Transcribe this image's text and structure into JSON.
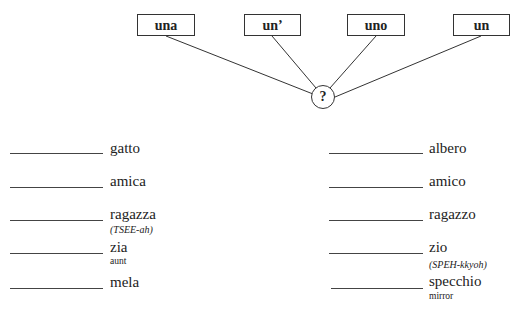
{
  "diagram": {
    "articles": [
      {
        "label": "una"
      },
      {
        "label": "un’"
      },
      {
        "label": "uno"
      },
      {
        "label": "un"
      }
    ],
    "center": {
      "label": "?"
    }
  },
  "exercise": {
    "left": [
      {
        "word": "gatto"
      },
      {
        "word": "amica"
      },
      {
        "word": "ragazza",
        "pronunciation": "(TSEE-ah)"
      },
      {
        "word": "zia",
        "gloss": "aunt"
      },
      {
        "word": "mela"
      }
    ],
    "right": [
      {
        "word": "albero"
      },
      {
        "word": "amico"
      },
      {
        "word": "ragazzo"
      },
      {
        "word": "zio",
        "pronunciation": "(SPEH-kkyoh)"
      },
      {
        "word": "specchio",
        "gloss": "mirror"
      }
    ]
  },
  "colors": {
    "ink": "#222222",
    "background": "#ffffff"
  }
}
